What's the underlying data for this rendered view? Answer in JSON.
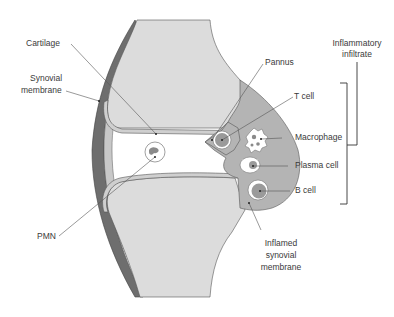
{
  "diagram": {
    "labels": {
      "cartilage": "Cartilage",
      "synovial_membrane_1": "Synovial",
      "synovial_membrane_2": "membrane",
      "pannus": "Pannus",
      "t_cell": "T cell",
      "macrophage": "Macrophage",
      "plasma_cell": "Plasma cell",
      "b_cell": "B cell",
      "pmn": "PMN",
      "inflamed_1": "Inflamed",
      "inflamed_2": "synovial",
      "inflamed_3": "membrane",
      "infiltrate_1": "Inflammatory",
      "infiltrate_2": "infiltrate"
    },
    "colors": {
      "bone": "#dcdcdc",
      "capsule_dark": "#6e6e6e",
      "synovium_light": "#c4c4c4",
      "inflamed": "#b4b4b4",
      "outline": "#4a4a4a",
      "leader": "#555555",
      "cell_core": "#8a8a8a"
    }
  }
}
